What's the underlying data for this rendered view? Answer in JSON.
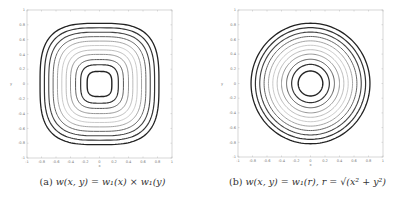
{
  "chart_data": [
    {
      "type": "contour",
      "panel": "a",
      "title": "",
      "caption": "(a) w(x, y) = w1(x) × w1(y)",
      "caption_label": "(a)",
      "caption_expr": "w(x, y) = w₁(x) × w₁(y)",
      "xlabel": "x",
      "ylabel": "y",
      "xlim": [
        -1,
        1
      ],
      "ylim": [
        -1,
        1
      ],
      "xticks": [
        "-1",
        "-0.8",
        "-0.6",
        "-0.4",
        "-0.2",
        "0",
        "0.2",
        "0.4",
        "0.6",
        "0.8",
        "1"
      ],
      "yticks": [
        "-1",
        "-0.8",
        "-0.6",
        "-0.4",
        "-0.2",
        "0",
        "0.2",
        "0.4",
        "0.6",
        "0.8",
        "1"
      ],
      "grid": false,
      "shape": "squircle",
      "squircle_exponent": 3.2,
      "levels": [
        {
          "radius": 0.17,
          "color": "#222222",
          "width": 1.4
        },
        {
          "radius": 0.26,
          "color": "#333333",
          "width": 1.2
        },
        {
          "radius": 0.33,
          "color": "#555555",
          "width": 1.0
        },
        {
          "radius": 0.4,
          "color": "#888888",
          "width": 0.9
        },
        {
          "radius": 0.46,
          "color": "#aaaaaa",
          "width": 0.8
        },
        {
          "radius": 0.52,
          "color": "#bbbbbb",
          "width": 0.8
        },
        {
          "radius": 0.58,
          "color": "#999999",
          "width": 0.9
        },
        {
          "radius": 0.64,
          "color": "#666666",
          "width": 1.0
        },
        {
          "radius": 0.7,
          "color": "#444444",
          "width": 1.1
        },
        {
          "radius": 0.76,
          "color": "#333333",
          "width": 1.2
        },
        {
          "radius": 0.82,
          "color": "#222222",
          "width": 1.3
        }
      ]
    },
    {
      "type": "contour",
      "panel": "b",
      "title": "",
      "caption": "(b) w(x, y) = w1(r), r = sqrt(x^2 + y^2)",
      "caption_label": "(b)",
      "caption_expr": "w(x, y) = w₁(r), r = √(x² + y²)",
      "xlabel": "x",
      "ylabel": "y",
      "xlim": [
        -1,
        1
      ],
      "ylim": [
        -1,
        1
      ],
      "xticks": [
        "-1",
        "-0.8",
        "-0.6",
        "-0.4",
        "-0.2",
        "0",
        "0.2",
        "0.4",
        "0.6",
        "0.8",
        "1"
      ],
      "yticks": [
        "-1",
        "-0.8",
        "-0.6",
        "-0.4",
        "-0.2",
        "0",
        "0.2",
        "0.4",
        "0.6",
        "0.8",
        "1"
      ],
      "grid": false,
      "shape": "circle",
      "squircle_exponent": 2,
      "levels": [
        {
          "radius": 0.17,
          "color": "#222222",
          "width": 1.4
        },
        {
          "radius": 0.26,
          "color": "#333333",
          "width": 1.2
        },
        {
          "radius": 0.33,
          "color": "#555555",
          "width": 1.0
        },
        {
          "radius": 0.4,
          "color": "#888888",
          "width": 0.9
        },
        {
          "radius": 0.46,
          "color": "#aaaaaa",
          "width": 0.8
        },
        {
          "radius": 0.52,
          "color": "#bbbbbb",
          "width": 0.8
        },
        {
          "radius": 0.58,
          "color": "#999999",
          "width": 0.9
        },
        {
          "radius": 0.64,
          "color": "#666666",
          "width": 1.0
        },
        {
          "radius": 0.7,
          "color": "#444444",
          "width": 1.1
        },
        {
          "radius": 0.76,
          "color": "#333333",
          "width": 1.2
        },
        {
          "radius": 0.82,
          "color": "#222222",
          "width": 1.3
        }
      ]
    }
  ],
  "figure": {
    "axes_color": "#bbbbbb",
    "tick_color": "#777777"
  }
}
